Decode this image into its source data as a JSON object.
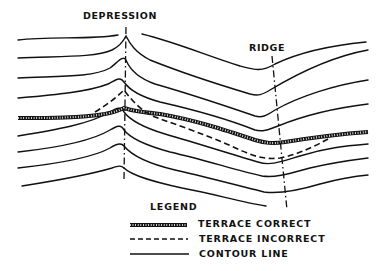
{
  "labels": {
    "depression": "DEPRESSION",
    "ridge": "RIDGE"
  },
  "legend": {
    "title": "LEGEND",
    "items": [
      {
        "symbol": "thick-hatched-line",
        "label": "TERRACE CORRECT"
      },
      {
        "symbol": "dashed-line",
        "label": "TERRACE INCORRECT"
      },
      {
        "symbol": "solid-line",
        "label": "CONTOUR LINE"
      }
    ]
  },
  "colors": {
    "ink": "#111111",
    "background": "#ffffff"
  }
}
